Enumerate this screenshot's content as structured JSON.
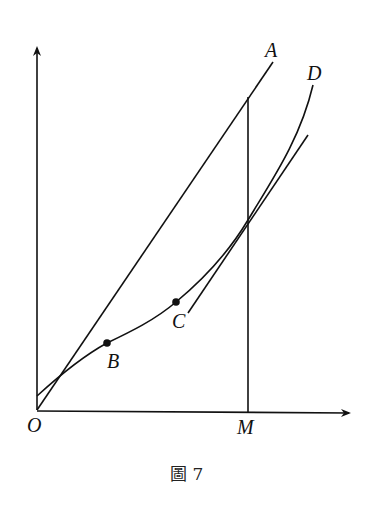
{
  "figure": {
    "caption": "圖 7",
    "labels": {
      "origin": "O",
      "line_a": "A",
      "curve_d": "D",
      "point_b": "B",
      "point_c": "C",
      "point_m": "M"
    },
    "colors": {
      "stroke": "#111111",
      "background": "#ffffff"
    },
    "elements": [
      {
        "name": "y-axis",
        "type": "arrow",
        "from": [
          37,
          410
        ],
        "to": [
          37,
          45
        ]
      },
      {
        "name": "x-axis",
        "type": "arrow",
        "from": [
          37,
          411
        ],
        "to": [
          352,
          413
        ]
      },
      {
        "name": "line-OA",
        "type": "line",
        "from": [
          37,
          410
        ],
        "to": [
          273,
          62
        ]
      },
      {
        "name": "vertical-M",
        "type": "line",
        "from": [
          248,
          97
        ],
        "to": [
          248,
          413
        ]
      },
      {
        "name": "curve-D",
        "type": "curve",
        "points": [
          [
            37,
            396
          ],
          [
            107,
            343
          ],
          [
            176,
            302
          ],
          [
            248,
            220
          ],
          [
            313,
            85
          ]
        ]
      },
      {
        "name": "tangent-line-C",
        "type": "line",
        "from": [
          188,
          313
        ],
        "to": [
          308,
          135
        ]
      }
    ]
  }
}
